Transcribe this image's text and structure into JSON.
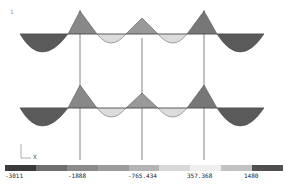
{
  "diagram": {
    "type": "frame bending moment contour",
    "corner_mark": "1",
    "axis": {
      "x_label": "X",
      "y_label": "Y"
    },
    "structure": {
      "stories": 2,
      "bays": 3,
      "column_x": [
        80,
        142,
        204
      ],
      "beam_y": [
        47,
        109
      ],
      "beam_x_range": [
        20,
        265
      ]
    }
  },
  "legend": {
    "colors": [
      "#3a3a3a",
      "#6e6e6e",
      "#8a8a8a",
      "#9c9c9c",
      "#b4b4b4",
      "#d8d8d8",
      "#eeeeee",
      "#c2c2c2",
      "#505050"
    ],
    "ticks": [
      {
        "label": "-3011",
        "x": 5
      },
      {
        "label": "-1888",
        "x": 68
      },
      {
        "label": "-765.434",
        "x": 128
      },
      {
        "label": "357.368",
        "x": 187
      },
      {
        "label": "1480",
        "x": 244
      }
    ]
  }
}
